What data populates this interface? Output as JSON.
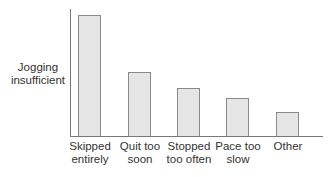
{
  "chart_data": {
    "type": "bar",
    "title": "",
    "xlabel": "",
    "ylabel": "Jogging insufficient",
    "ylabel_lines": [
      "Jogging",
      "insufficient"
    ],
    "categories": [
      "Skipped entirely",
      "Quit too soon",
      "Stopped too often",
      "Pace too slow",
      "Other"
    ],
    "category_lines": [
      [
        "Skipped",
        "entirely"
      ],
      [
        "Quit too",
        "soon"
      ],
      [
        "Stopped",
        "too often"
      ],
      [
        "Pace too",
        "slow"
      ],
      [
        "Other",
        ""
      ]
    ],
    "values": [
      100,
      53,
      40,
      31,
      20
    ],
    "value_note": "Relative bar heights (no numeric axis shown); tallest bar normalized to 100",
    "ylim": [
      0,
      105
    ],
    "grid": false,
    "legend": null,
    "colors": {
      "bar_fill": "#e6e6e6",
      "bar_border": "#8a8a8a",
      "axis": "#777777"
    }
  }
}
